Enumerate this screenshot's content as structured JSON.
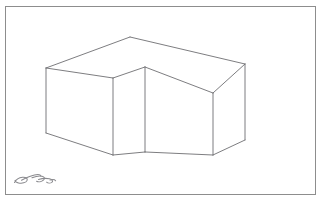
{
  "document": {
    "title": "Isometric L-Shaped Block Sketch",
    "medium": "line drawing on white paper",
    "background_color": "#ffffff"
  },
  "frame": {
    "name": "sheet-border",
    "stroke_color": "#8d8d8d",
    "stroke_width": 1,
    "x": 5,
    "y": 6,
    "width": 311,
    "height": 189
  },
  "drawing": {
    "name": "isometric-l-block",
    "description": "Wireframe isometric projection of an L-shaped rectangular block",
    "stroke_color": "#6e6e72",
    "stroke_width": 0.9,
    "fill": "none",
    "vertices": {
      "top_back_apex": [
        130,
        37
      ],
      "top_left": [
        46,
        68
      ],
      "top_right": [
        245,
        64
      ],
      "top_inner_front": [
        145,
        67
      ],
      "top_mid_front_left": [
        113,
        78
      ],
      "top_inner_right": [
        213,
        93
      ],
      "bottom_left": [
        46,
        133
      ],
      "bottom_front_left": [
        113,
        155
      ],
      "bottom_inner": [
        145,
        152
      ],
      "bottom_inner_right": [
        213,
        155
      ],
      "bottom_right": [
        245,
        140
      ],
      "bottom_far_right": [
        245,
        133
      ]
    },
    "edges": [
      {
        "name": "top-face-back-left",
        "from": [
          46,
          68
        ],
        "to": [
          130,
          37
        ]
      },
      {
        "name": "top-face-back-right",
        "from": [
          130,
          37
        ],
        "to": [
          245,
          64
        ]
      },
      {
        "name": "top-face-front-left",
        "from": [
          46,
          68
        ],
        "to": [
          113,
          78
        ]
      },
      {
        "name": "top-face-notch-left",
        "from": [
          113,
          78
        ],
        "to": [
          145,
          67
        ]
      },
      {
        "name": "top-face-notch-right",
        "from": [
          145,
          67
        ],
        "to": [
          213,
          93
        ]
      },
      {
        "name": "top-face-front-right",
        "from": [
          213,
          93
        ],
        "to": [
          245,
          64
        ]
      },
      {
        "name": "vertical-left",
        "from": [
          46,
          68
        ],
        "to": [
          46,
          133
        ]
      },
      {
        "name": "vertical-front-left",
        "from": [
          113,
          78
        ],
        "to": [
          113,
          155
        ]
      },
      {
        "name": "vertical-inner",
        "from": [
          145,
          67
        ],
        "to": [
          145,
          152
        ]
      },
      {
        "name": "vertical-inner-right",
        "from": [
          213,
          93
        ],
        "to": [
          213,
          155
        ]
      },
      {
        "name": "vertical-right",
        "from": [
          245,
          64
        ],
        "to": [
          245,
          140
        ]
      },
      {
        "name": "bottom-left-face",
        "from": [
          46,
          133
        ],
        "to": [
          113,
          155
        ]
      },
      {
        "name": "bottom-notch-left",
        "from": [
          113,
          155
        ],
        "to": [
          145,
          152
        ]
      },
      {
        "name": "bottom-notch-right",
        "from": [
          145,
          152
        ],
        "to": [
          213,
          155
        ]
      },
      {
        "name": "bottom-right-face",
        "from": [
          213,
          155
        ],
        "to": [
          245,
          140
        ]
      },
      {
        "name": "top-apex-drop",
        "from": [
          130,
          37
        ],
        "to": [
          130,
          37
        ]
      }
    ]
  },
  "signature": {
    "name": "artist-signature",
    "label": "handwritten signature mark",
    "stroke_color": "#8a8a8e",
    "x": 12,
    "y": 168,
    "width": 46,
    "height": 22
  }
}
